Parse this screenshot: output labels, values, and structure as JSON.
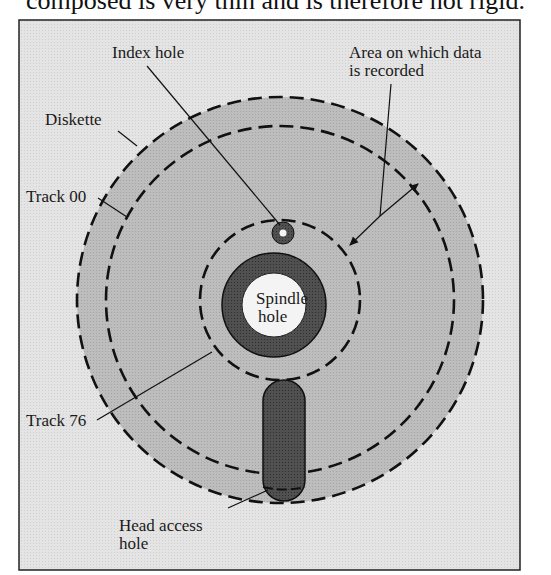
{
  "header": {
    "partial_text": "composed is very thin and is therefore not rigid."
  },
  "diagram": {
    "colors": {
      "frame_bg": "#e6e6e6",
      "disk_fill": "#b9b9b9",
      "dark_ring": "#4a4a4a",
      "hole_white": "#f4f4f4",
      "line": "#111111"
    },
    "labels": {
      "index_hole": "Index hole",
      "area_line1": "Area on which data",
      "area_line2": "is recorded",
      "diskette": "Diskette",
      "track_00": "Track 00",
      "spindle_line1": "Spindle",
      "spindle_line2": "hole",
      "track_76": "Track 76",
      "head_line1": "Head access",
      "head_line2": "hole"
    }
  }
}
